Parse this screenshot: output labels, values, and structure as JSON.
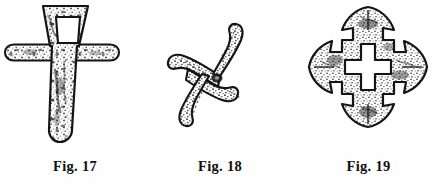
{
  "plate": {
    "background_color": "#fefefe",
    "ink_color": "#1a1a1a",
    "figure_count": 3,
    "medium": "engraved line illustration of archaeological metal artifacts"
  },
  "figures": [
    {
      "id": "fig-17",
      "caption": "Fig. 17",
      "object_name": "cruciform socketed blade",
      "description": "Tapering dagger-like blade with trapezoidal perforated head and horizontal rounded crossbar",
      "parts": [
        {
          "name": "head-plate",
          "shape": "trapezoid, wider at top"
        },
        {
          "name": "rectangular-perforation",
          "shape": "rectangular opening in head"
        },
        {
          "name": "crossbar",
          "shape": "horizontal rounded bar"
        },
        {
          "name": "blade",
          "shape": "long tapering point, rounded tip"
        }
      ],
      "fill_texture": "stippled / mottled corrosion hatching",
      "outline_color": "#141414"
    },
    {
      "id": "fig-18",
      "caption": "Fig. 18",
      "object_name": "four-armed curved swastika ornament",
      "description": "Pinwheel with four curved sickle-shaped tapering arms radiating from a small central boss",
      "parts": [
        {
          "name": "arm-upper-left",
          "shape": "curved hook sweeping left"
        },
        {
          "name": "arm-upper-right",
          "shape": "curved hook sweeping up-right"
        },
        {
          "name": "arm-lower-left",
          "shape": "curved hook sweeping down-left"
        },
        {
          "name": "arm-lower-right",
          "shape": "curved hook sweeping right"
        },
        {
          "name": "center-boss",
          "shape": "small dark node"
        }
      ],
      "arm_count": 4,
      "fill_texture": "stippled / mottled corrosion hatching",
      "outline_color": "#141414"
    },
    {
      "id": "fig-19",
      "caption": "Fig. 19",
      "object_name": "arrow-terminal cross brooch",
      "description": "Equal-armed cross with flared arrowhead terminals on all four arms and an open cross-shaped void at the centre",
      "parts": [
        {
          "name": "arm-top",
          "shape": "stepped arm with arrowhead terminal"
        },
        {
          "name": "arm-right",
          "shape": "stepped arm with arrowhead terminal"
        },
        {
          "name": "arm-bottom",
          "shape": "stepped arm with arrowhead terminal"
        },
        {
          "name": "arm-left",
          "shape": "stepped arm with arrowhead terminal"
        },
        {
          "name": "inner-cross-void",
          "shape": "open cross-shaped perforation"
        }
      ],
      "arm_count": 4,
      "fill_texture": "stippled / mottled corrosion hatching",
      "outline_color": "#141414"
    }
  ]
}
